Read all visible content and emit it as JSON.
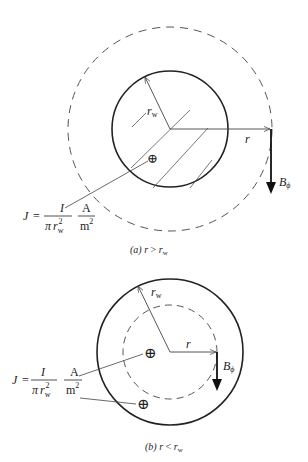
{
  "figure_a": {
    "caption_prefix": "(a) ",
    "caption_r": "r",
    "caption_op": " > ",
    "caption_rw": "r",
    "caption_rw_sub": "w",
    "label_rw": "r",
    "label_rw_sub": "w",
    "label_r": "r",
    "label_B": "B",
    "label_B_sub": "ϕ",
    "current_symbol": "⊕"
  },
  "figure_b": {
    "caption_prefix": "(b) ",
    "caption_r": "r",
    "caption_op": " < ",
    "caption_rw": "r",
    "caption_rw_sub": "w",
    "label_rw": "r",
    "label_rw_sub": "w",
    "label_r": "r",
    "label_B": "B",
    "label_B_sub": "ϕ",
    "current_symbol": "⊕"
  },
  "formula": {
    "lhs": "J",
    "eq": "=",
    "numerator": "I",
    "denominator_pi": "π",
    "denominator_r": "r",
    "denominator_sub": "w",
    "denominator_sup": "2",
    "unit_num": "A",
    "unit_den": "m",
    "unit_den_sup": "2"
  },
  "colors": {
    "stroke": "#222222",
    "dash": "#555555",
    "background": "#ffffff"
  }
}
